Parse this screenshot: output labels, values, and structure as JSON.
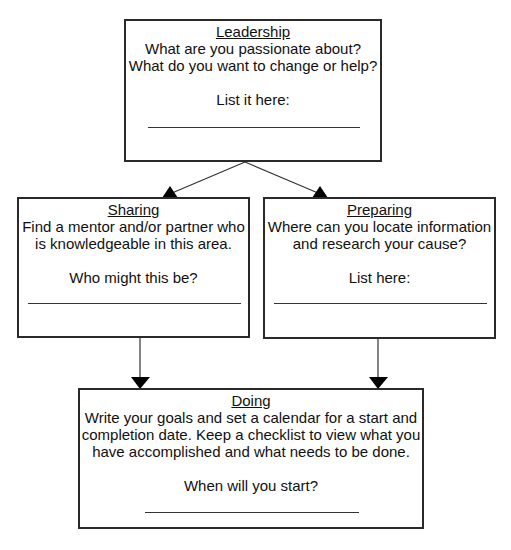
{
  "diagram": {
    "type": "flowchart",
    "nodes": [
      {
        "id": "leadership",
        "title": "Leadership",
        "body_lines": [
          "What are you passionate about?",
          "What do you want to change or help?"
        ],
        "prompt": "List it here:",
        "answer": ""
      },
      {
        "id": "sharing",
        "title": "Sharing",
        "body_lines": [
          "Find a mentor and/or partner who",
          "is knowledgeable in this area."
        ],
        "prompt": "Who might this be?",
        "answer": ""
      },
      {
        "id": "preparing",
        "title": "Preparing",
        "body_lines": [
          "Where can you locate information",
          "and research your cause?"
        ],
        "prompt": "List here:",
        "answer": ""
      },
      {
        "id": "doing",
        "title": "Doing",
        "body_lines": [
          "Write your goals and set a calendar for a start and",
          "completion date. Keep a checklist to view what you",
          "have accomplished and what needs to be done."
        ],
        "prompt": "When will you start?",
        "answer": ""
      }
    ],
    "edges": [
      {
        "from": "leadership",
        "to": "sharing"
      },
      {
        "from": "leadership",
        "to": "preparing"
      },
      {
        "from": "sharing",
        "to": "doing"
      },
      {
        "from": "preparing",
        "to": "doing"
      }
    ],
    "colors": {
      "stroke": "#2a2a2a",
      "background": "#ffffff",
      "text": "#111111"
    }
  }
}
